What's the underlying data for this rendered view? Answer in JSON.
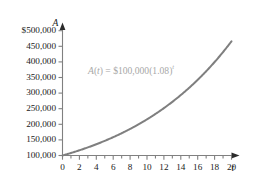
{
  "chart_data": {
    "type": "line",
    "title": "",
    "xlabel": "t",
    "ylabel": "A",
    "equation_text": "A(t) = $100,000(1.08)^t",
    "equation_parts": {
      "func": "A",
      "open": "(",
      "arg": "t",
      "close": ")",
      "equals": " = ",
      "principal": "$100,000",
      "base_open": "(",
      "base": "1.08",
      "base_close": ")",
      "exponent": "t"
    },
    "formula": {
      "principal": 100000,
      "rate": 1.08,
      "currency": "$"
    },
    "xlim": [
      0,
      21.5
    ],
    "ylim": [
      100000,
      512000
    ],
    "x_major_step": 2,
    "x_minor_step": 1,
    "y_major_step": 50000,
    "grid": false,
    "legend": null,
    "line_color": "#7f7f7f",
    "axis_color": "#808080",
    "text_color": "#1a1a1a",
    "equation_color": "#a8a8a8",
    "x_tick_labels": [
      "0",
      "2",
      "4",
      "6",
      "8",
      "10",
      "12",
      "14",
      "16",
      "18",
      "20"
    ],
    "x_tick_values": [
      0,
      2,
      4,
      6,
      8,
      10,
      12,
      14,
      16,
      18,
      20
    ],
    "y_tick_labels": [
      "$500,000",
      "450,000",
      "400,000",
      "350,000",
      "300,000",
      "250,000",
      "200,000",
      "150,000",
      "100,000"
    ],
    "y_tick_values": [
      500000,
      450000,
      400000,
      350000,
      300000,
      250000,
      200000,
      150000,
      100000
    ],
    "x": [
      0,
      1,
      2,
      3,
      4,
      5,
      6,
      7,
      8,
      9,
      10,
      11,
      12,
      13,
      14,
      15,
      16,
      17,
      18,
      19,
      20
    ],
    "values": [
      100000,
      108000,
      116640,
      125971,
      136049,
      146933,
      158687,
      171382,
      185093,
      199900,
      215892,
      233164,
      251817,
      271962,
      293719,
      317217,
      342594,
      370002,
      399602,
      431570,
      466096
    ]
  }
}
